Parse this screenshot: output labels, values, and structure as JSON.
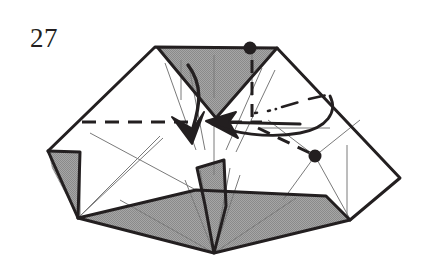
{
  "figure": {
    "label": "27",
    "kind": "origami-folding-diagram",
    "caption_text": "27",
    "colors": {
      "ink": "#231f20",
      "paper_front": "#ffffff",
      "paper_back_shade": "#9a9a9a",
      "crease_thin": "#6f6f6f",
      "background": "#ffffff"
    },
    "line_styles": {
      "outline": "solid-heavy",
      "valley_fold": "dashed",
      "hidden_edge": "dash-dot",
      "crease": "thin-solid"
    },
    "markers": [
      {
        "name": "reference-dot-top",
        "x": 250,
        "y": 48,
        "r": 6
      },
      {
        "name": "reference-dot-right",
        "x": 315,
        "y": 156,
        "r": 6
      }
    ],
    "arrows": [
      {
        "name": "fold-arrow-down",
        "direction": "down",
        "style": "solid-curved"
      },
      {
        "name": "fold-arrow-left",
        "direction": "left",
        "style": "solid-straight"
      },
      {
        "name": "tuck-arrow-curved",
        "direction": "left",
        "style": "curved-sweep"
      }
    ],
    "shaded_regions": [
      {
        "name": "top-inverted-triangle"
      },
      {
        "name": "left-small-flap"
      },
      {
        "name": "bottom-band"
      },
      {
        "name": "center-spike"
      }
    ],
    "outline_points": "155,47 277,48 400,178 350,220 214,253 78,218 48,151"
  }
}
